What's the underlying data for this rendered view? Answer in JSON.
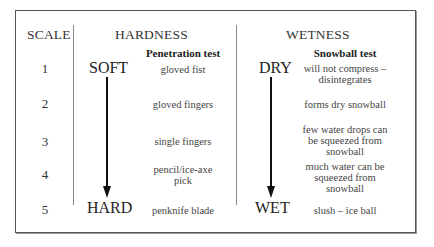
{
  "table": {
    "headers": {
      "scale": "SCALE",
      "hardness": "HARDNESS",
      "wetness": "WETNESS"
    },
    "subheaders": {
      "hardness": "Penetration test",
      "wetness": "Snowball test"
    },
    "hardness_range": {
      "top": "SOFT",
      "bottom": "HARD"
    },
    "wetness_range": {
      "top": "DRY",
      "bottom": "WET"
    },
    "rows": [
      {
        "scale": "1",
        "hardness": "gloved fist",
        "wetness": "will not compress – disintegrates"
      },
      {
        "scale": "2",
        "hardness": "gloved fingers",
        "wetness": "forms dry snowball"
      },
      {
        "scale": "3",
        "hardness": "single fingers",
        "wetness": "few water drops can be squeezed from snowball"
      },
      {
        "scale": "4",
        "hardness": "pencil/ice-axe pick",
        "wetness": "much water can be squeezed from snowball"
      },
      {
        "scale": "5",
        "hardness": "penknife blade",
        "wetness": "slush – ice ball"
      }
    ],
    "arrow_icons": {
      "hardness": "arrow-down-icon",
      "wetness": "arrow-down-icon"
    }
  }
}
